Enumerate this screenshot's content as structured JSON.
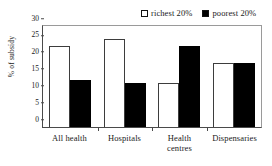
{
  "chart_data": {
    "type": "bar",
    "title": "",
    "xlabel": "",
    "ylabel": "% of subsidy",
    "ylim": [
      0,
      30
    ],
    "yticks": [
      0,
      5,
      10,
      15,
      20,
      25,
      30
    ],
    "grid": false,
    "legend_position": "top-right",
    "categories": [
      "All health",
      "Hospitals",
      "Health centres",
      "Dispensaries"
    ],
    "category_lines": [
      [
        "All health"
      ],
      [
        "Hospitals"
      ],
      [
        "Health",
        "centres"
      ],
      [
        "Dispensaries"
      ]
    ],
    "series": [
      {
        "name": "richest 20%",
        "color": "#ffffff",
        "edge_color": "#3d3d3d",
        "marker": "hollow-square",
        "values": [
          24,
          26,
          13,
          19
        ]
      },
      {
        "name": "poorest 20%",
        "color": "#000000",
        "edge_color": "#000000",
        "marker": "filled-square",
        "values": [
          14,
          13,
          24,
          19
        ]
      }
    ]
  }
}
